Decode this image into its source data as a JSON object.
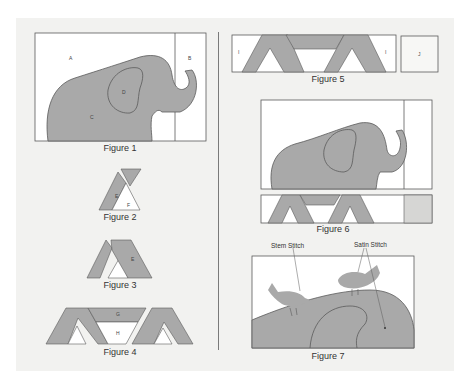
{
  "figures": [
    {
      "id": "fig1",
      "caption": "Figure 1",
      "labels": [
        "A",
        "B",
        "C",
        "D"
      ]
    },
    {
      "id": "fig2",
      "caption": "Figure 2",
      "labels": [
        "E",
        "F"
      ]
    },
    {
      "id": "fig3",
      "caption": "Figure 3",
      "labels": [
        "E"
      ]
    },
    {
      "id": "fig4",
      "caption": "Figure 4",
      "labels": [
        "G",
        "H"
      ]
    },
    {
      "id": "fig5",
      "caption": "Figure 5",
      "labels": [
        "I",
        "I",
        "J"
      ]
    },
    {
      "id": "fig6",
      "caption": "Figure 6",
      "labels": []
    },
    {
      "id": "fig7",
      "caption": "Figure 7",
      "labels": [],
      "annotations": [
        "Stem Stitch",
        "Satin Stitch"
      ]
    }
  ],
  "colors": {
    "fill": "#a9a9a9",
    "stroke": "#5a5a5a",
    "background": "#f2f2f0",
    "panel": "#ffffff"
  }
}
